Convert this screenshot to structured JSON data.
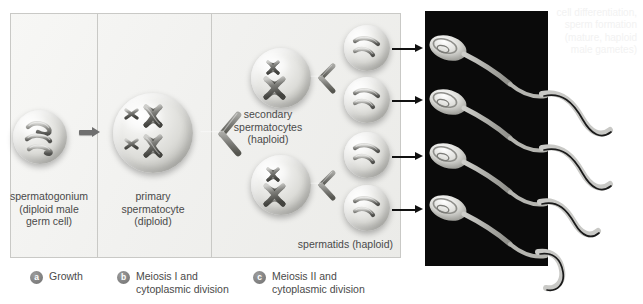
{
  "figure": {
    "background": "#ffffff",
    "panel_border": "#c9c9c6",
    "photo_background": "#0a0a0a"
  },
  "stages": [
    {
      "id": "spermatogonium",
      "caption": [
        "spermatogonium",
        "(diploid male",
        "germ cell)"
      ],
      "chromosome_count": 3,
      "chromosome_shape": "squiggle",
      "cell": {
        "cx": 40,
        "cy": 137,
        "r": 27
      }
    },
    {
      "id": "primary-spermatocyte",
      "caption": [
        "primary",
        "spermatocyte",
        "(diploid)"
      ],
      "chromosome_count": 4,
      "chromosome_shape": "bivalent-x",
      "cell": {
        "cx": 153,
        "cy": 133,
        "r": 40
      }
    },
    {
      "id": "secondary-spermatocytes",
      "caption": [
        "secondary",
        "spermatocytes",
        "(haploid)"
      ],
      "chromosome_count": 2,
      "chromosome_shape": "x",
      "cells": [
        {
          "cx": 281,
          "cy": 78,
          "r": 30
        },
        {
          "cx": 281,
          "cy": 185,
          "r": 30
        }
      ]
    },
    {
      "id": "spermatids",
      "caption": [
        "spermatids (haploid)"
      ],
      "chromosome_count": 2,
      "chromosome_shape": "curved-rod",
      "cells": [
        {
          "cx": 367,
          "cy": 48,
          "r": 23
        },
        {
          "cx": 367,
          "cy": 100,
          "r": 23
        },
        {
          "cx": 367,
          "cy": 155,
          "r": 23
        },
        {
          "cx": 367,
          "cy": 208,
          "r": 23
        }
      ]
    }
  ],
  "legend": [
    {
      "marker": "a",
      "lines": [
        "Growth"
      ]
    },
    {
      "marker": "b",
      "lines": [
        "Meiosis I and",
        "cytoplasmic division"
      ]
    },
    {
      "marker": "c",
      "lines": [
        "Meiosis II and",
        "cytoplasmic division"
      ]
    }
  ],
  "photo": {
    "label_lines": [
      "cell differentiation,",
      "sperm formation",
      "(mature, haploid",
      "male gametes)"
    ],
    "sperm_count": 4
  },
  "connectors": {
    "growth_arrow": "arrow-right",
    "meiosis_one_split": "y-split",
    "meiosis_two_split": "y-split",
    "differentiation_arrows": 4
  }
}
